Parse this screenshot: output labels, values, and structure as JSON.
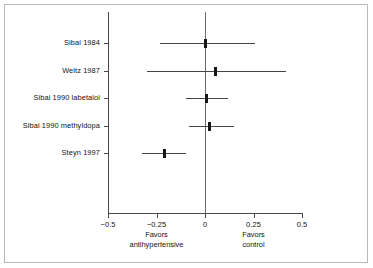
{
  "figure": {
    "name": "forest-plot",
    "background_color": "#ffffff",
    "border_color": "#b9b9b9",
    "line_color": "#4a4a4a",
    "marker_color": "#151515"
  },
  "axis": {
    "x_tick_labels": [
      "−0.5",
      "−0.25",
      "0",
      "0.25",
      "0.5"
    ],
    "x_tick_values": [
      -0.5,
      -0.25,
      0,
      0.25,
      0.5
    ],
    "favors_left_line1": "Favors",
    "favors_left_line2": "antihypertensive",
    "favors_right_line1": "Favors",
    "favors_right_line2": "control"
  },
  "chart_data": {
    "type": "scatter",
    "title": "",
    "xlabel": "",
    "ylabel": "",
    "xlim": [
      -0.5,
      0.5
    ],
    "grid": false,
    "legend": "none",
    "reference_line": 0,
    "categories": [
      "Sibai 1984",
      "Weitz 1987",
      "Sibai 1990 labetalol",
      "Sibai 1990 methyldopa",
      "Steyn 1997"
    ],
    "series": [
      {
        "name": "Risk difference",
        "values": [
          0.005,
          0.055,
          0.01,
          0.025,
          -0.21
        ],
        "ci_low": [
          -0.23,
          -0.3,
          -0.1,
          -0.08,
          -0.325
        ],
        "ci_high": [
          0.26,
          0.42,
          0.12,
          0.15,
          -0.1
        ]
      }
    ],
    "points": [
      {
        "label": "Sibai 1984",
        "estimate": 0.005,
        "ci_low": -0.23,
        "ci_high": 0.26
      },
      {
        "label": "Weitz 1987",
        "estimate": 0.055,
        "ci_low": -0.3,
        "ci_high": 0.42
      },
      {
        "label": "Sibai 1990 labetalol",
        "estimate": 0.01,
        "ci_low": -0.1,
        "ci_high": 0.12
      },
      {
        "label": "Sibai 1990 methyldopa",
        "estimate": 0.025,
        "ci_low": -0.08,
        "ci_high": 0.15
      },
      {
        "label": "Steyn 1997",
        "estimate": -0.21,
        "ci_low": -0.325,
        "ci_high": -0.1
      }
    ]
  }
}
